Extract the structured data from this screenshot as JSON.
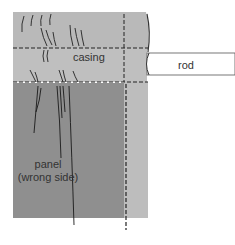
{
  "labels": {
    "casing": "casing",
    "rod": "rod",
    "panel_line1": "panel",
    "panel_line2": "(wrong side)"
  },
  "colors": {
    "background": "#ffffff",
    "fabric_light": "#bdbdbd",
    "fabric_mid": "#b2b2b2",
    "panel_dark": "#8f8f8f",
    "rod_fill": "#ffffff",
    "stroke": "#222222",
    "text": "#333333"
  }
}
